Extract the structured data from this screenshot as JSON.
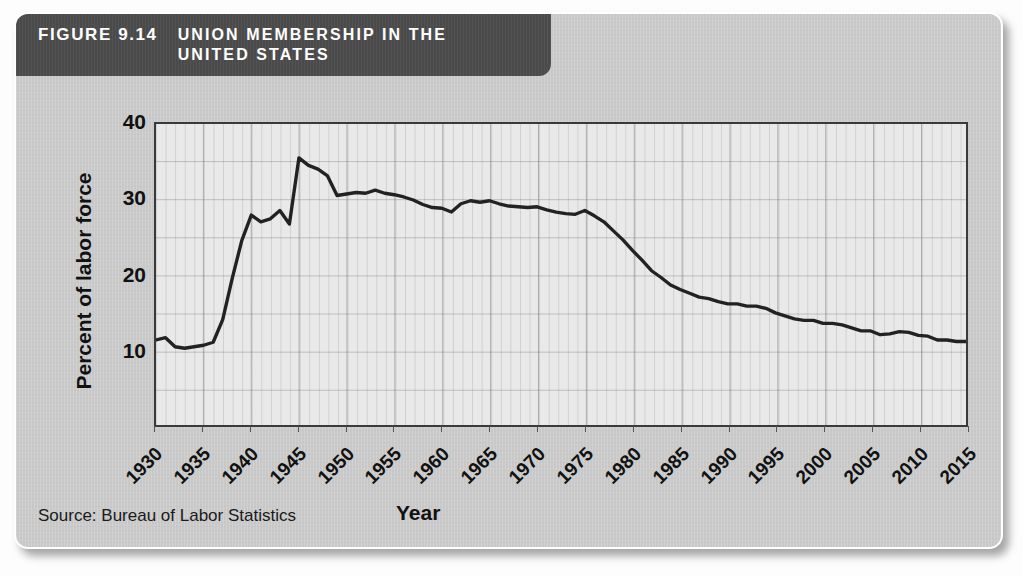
{
  "figure": {
    "number_label": "FIGURE 9.14",
    "title": "UNION MEMBERSHIP IN THE UNITED STATES",
    "source_note": "Source: Bureau of Labor Statistics",
    "banner_color": "#4a4a4a",
    "card_color": "#c9c9c9",
    "plot_color": "#e9e9e9",
    "line_color": "#222222"
  },
  "chart_data": {
    "type": "line",
    "title": "UNION MEMBERSHIP IN THE UNITED STATES",
    "xlabel": "Year",
    "ylabel": "Percent of labor force",
    "xlim": [
      1930,
      2015
    ],
    "ylim": [
      0,
      40
    ],
    "yticks": [
      10,
      20,
      30,
      40
    ],
    "xticks": [
      1930,
      1935,
      1940,
      1945,
      1950,
      1955,
      1960,
      1965,
      1970,
      1975,
      1980,
      1985,
      1990,
      1995,
      2000,
      2005,
      2010,
      2015
    ],
    "grid": true,
    "legend": "none",
    "series": [
      {
        "name": "Union membership (percent of labor force)",
        "x": [
          1930,
          1931,
          1932,
          1933,
          1934,
          1935,
          1936,
          1937,
          1938,
          1939,
          1940,
          1941,
          1942,
          1943,
          1944,
          1945,
          1946,
          1947,
          1948,
          1949,
          1950,
          1951,
          1952,
          1953,
          1954,
          1955,
          1956,
          1957,
          1958,
          1959,
          1960,
          1961,
          1962,
          1963,
          1964,
          1965,
          1966,
          1967,
          1968,
          1969,
          1970,
          1971,
          1972,
          1973,
          1974,
          1975,
          1976,
          1977,
          1978,
          1979,
          1980,
          1981,
          1982,
          1983,
          1984,
          1985,
          1986,
          1987,
          1988,
          1989,
          1990,
          1991,
          1992,
          1993,
          1994,
          1995,
          1996,
          1997,
          1998,
          1999,
          2000,
          2001,
          2002,
          2003,
          2004,
          2005,
          2006,
          2007,
          2008,
          2009,
          2010,
          2011,
          2012,
          2013,
          2014,
          2015
        ],
        "y": [
          11.3,
          11.6,
          10.4,
          10.2,
          10.4,
          10.6,
          11.0,
          14.0,
          19.5,
          24.5,
          27.9,
          27.0,
          27.4,
          28.5,
          26.7,
          35.5,
          34.5,
          34.0,
          33.1,
          30.5,
          30.7,
          30.9,
          30.8,
          31.2,
          30.8,
          30.6,
          30.3,
          29.9,
          29.3,
          28.9,
          28.8,
          28.3,
          29.4,
          29.8,
          29.6,
          29.8,
          29.4,
          29.1,
          29.0,
          28.9,
          29.0,
          28.6,
          28.3,
          28.1,
          28.0,
          28.5,
          27.8,
          27.0,
          25.8,
          24.6,
          23.2,
          21.9,
          20.5,
          19.6,
          18.6,
          18.0,
          17.5,
          17.0,
          16.8,
          16.4,
          16.1,
          16.1,
          15.8,
          15.8,
          15.5,
          14.9,
          14.5,
          14.1,
          13.9,
          13.9,
          13.5,
          13.5,
          13.3,
          12.9,
          12.5,
          12.5,
          12.0,
          12.1,
          12.4,
          12.3,
          11.9,
          11.8,
          11.3,
          11.3,
          11.1,
          11.1
        ]
      }
    ]
  }
}
